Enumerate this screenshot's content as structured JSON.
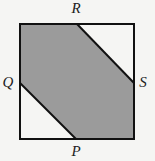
{
  "diagram": {
    "type": "geometry",
    "colors": {
      "background": "#f5f5f3",
      "shade": "#9b9b9b",
      "stroke": "#111111",
      "label": "#222222"
    },
    "square": {
      "x1": 20,
      "y1": 24,
      "x2": 134,
      "y2": 139
    },
    "points": {
      "R": {
        "label": "R",
        "x": 77,
        "y": 24,
        "lx": 76,
        "ly": 13
      },
      "Q": {
        "label": "Q",
        "x": 20,
        "y": 83,
        "lx": 8,
        "ly": 87
      },
      "P": {
        "label": "P",
        "x": 76,
        "y": 139,
        "lx": 76,
        "ly": 156
      },
      "S": {
        "label": "S",
        "x": 134,
        "y": 83,
        "lx": 143,
        "ly": 87
      }
    },
    "segments": [
      "RS",
      "QP"
    ],
    "shaded_polygon": [
      [
        20,
        24
      ],
      [
        77,
        24
      ],
      [
        134,
        83
      ],
      [
        134,
        139
      ],
      [
        76,
        139
      ],
      [
        20,
        83
      ]
    ]
  }
}
